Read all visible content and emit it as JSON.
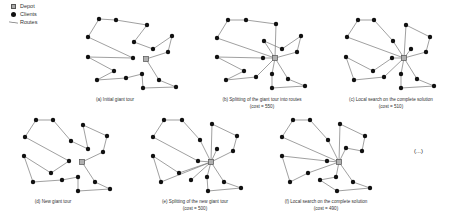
{
  "legend": {
    "depot_label": "Depot",
    "clients_label": "Clients",
    "routes_label": "Routes"
  },
  "colors": {
    "edge": "#777777",
    "client": "#111111",
    "depot_fill": "#b0b0b0",
    "depot_stroke": "#555555"
  },
  "panels": [
    {
      "id": "a",
      "caption": "(a) Initial giant tour",
      "cost": "",
      "caption_x": 115,
      "caption_y": 96,
      "depot": [
        146,
        59
      ],
      "clients": [
        [
          99,
          19
        ],
        [
          116,
          20
        ],
        [
          147,
          25
        ],
        [
          88,
          37
        ],
        [
          134,
          42
        ],
        [
          172,
          36
        ],
        [
          153,
          49
        ],
        [
          168,
          52
        ],
        [
          88,
          57
        ],
        [
          133,
          58
        ],
        [
          114,
          71
        ],
        [
          97,
          80
        ],
        [
          126,
          78
        ],
        [
          142,
          74
        ],
        [
          159,
          80
        ],
        [
          143,
          88
        ],
        [
          176,
          87
        ]
      ],
      "paths": [
        [
          [
            146,
            59
          ],
          [
            168,
            52
          ],
          [
            172,
            36
          ],
          [
            153,
            49
          ],
          [
            134,
            42
          ],
          [
            147,
            25
          ],
          [
            116,
            20
          ],
          [
            99,
            19
          ],
          [
            88,
            37
          ],
          [
            133,
            58
          ],
          [
            88,
            57
          ],
          [
            114,
            71
          ],
          [
            97,
            80
          ],
          [
            126,
            78
          ],
          [
            142,
            74
          ],
          [
            143,
            88
          ],
          [
            176,
            87
          ],
          [
            159,
            80
          ],
          [
            146,
            59
          ]
        ]
      ]
    },
    {
      "id": "b",
      "caption": "(b) Splitting of the giant tour into routes",
      "cost": "(cost = 550)",
      "caption_x": 262,
      "caption_y": 96,
      "depot": [
        275,
        58
      ],
      "clients": [
        [
          228,
          20
        ],
        [
          246,
          20
        ],
        [
          276,
          24
        ],
        [
          217,
          38
        ],
        [
          264,
          41
        ],
        [
          301,
          36
        ],
        [
          282,
          49
        ],
        [
          297,
          52
        ],
        [
          217,
          57
        ],
        [
          263,
          58
        ],
        [
          244,
          71
        ],
        [
          226,
          80
        ],
        [
          256,
          77
        ],
        [
          272,
          74
        ],
        [
          288,
          79
        ],
        [
          272,
          88
        ],
        [
          305,
          86
        ]
      ],
      "paths": [
        [
          [
            275,
            58
          ],
          [
            297,
            52
          ],
          [
            301,
            36
          ],
          [
            282,
            49
          ],
          [
            264,
            41
          ],
          [
            275,
            58
          ]
        ],
        [
          [
            275,
            58
          ],
          [
            276,
            24
          ],
          [
            246,
            20
          ],
          [
            228,
            20
          ],
          [
            217,
            38
          ],
          [
            275,
            58
          ]
        ],
        [
          [
            275,
            58
          ],
          [
            263,
            58
          ],
          [
            217,
            57
          ],
          [
            244,
            71
          ],
          [
            226,
            80
          ],
          [
            256,
            77
          ],
          [
            275,
            58
          ]
        ],
        [
          [
            275,
            58
          ],
          [
            272,
            74
          ],
          [
            272,
            88
          ],
          [
            305,
            86
          ],
          [
            288,
            79
          ],
          [
            275,
            58
          ]
        ]
      ]
    },
    {
      "id": "c",
      "caption": "(c) Local search on the complete solution",
      "cost": "(cost = 510)",
      "caption_x": 391,
      "caption_y": 96,
      "depot": [
        404,
        58
      ],
      "clients": [
        [
          358,
          20
        ],
        [
          374,
          20
        ],
        [
          347,
          37
        ],
        [
          393,
          41
        ],
        [
          406,
          25
        ],
        [
          430,
          37
        ],
        [
          411,
          49
        ],
        [
          426,
          52
        ],
        [
          346,
          57
        ],
        [
          392,
          58
        ],
        [
          373,
          71
        ],
        [
          354,
          80
        ],
        [
          384,
          77
        ],
        [
          401,
          74
        ],
        [
          417,
          79
        ],
        [
          401,
          88
        ],
        [
          434,
          86
        ]
      ],
      "paths": [
        [
          [
            404,
            58
          ],
          [
            406,
            25
          ],
          [
            430,
            37
          ],
          [
            426,
            52
          ],
          [
            404,
            58
          ]
        ],
        [
          [
            404,
            58
          ],
          [
            411,
            49
          ]
        ],
        [
          [
            404,
            58
          ],
          [
            393,
            41
          ],
          [
            374,
            20
          ],
          [
            358,
            20
          ],
          [
            347,
            37
          ],
          [
            404,
            58
          ]
        ],
        [
          [
            404,
            58
          ],
          [
            392,
            58
          ],
          [
            373,
            71
          ],
          [
            346,
            57
          ],
          [
            354,
            80
          ],
          [
            384,
            77
          ],
          [
            404,
            58
          ]
        ],
        [
          [
            404,
            58
          ],
          [
            401,
            74
          ],
          [
            401,
            88
          ],
          [
            434,
            86
          ],
          [
            417,
            79
          ],
          [
            404,
            58
          ]
        ]
      ]
    },
    {
      "id": "d",
      "caption": "(d) New giant tour",
      "cost": "",
      "caption_x": 53,
      "caption_y": 198,
      "depot": [
        82,
        162
      ],
      "clients": [
        [
          36,
          120
        ],
        [
          53,
          120
        ],
        [
          25,
          137
        ],
        [
          71,
          141
        ],
        [
          83,
          125
        ],
        [
          107,
          136
        ],
        [
          88,
          149
        ],
        [
          103,
          152
        ],
        [
          24,
          156
        ],
        [
          69,
          161
        ],
        [
          51,
          173
        ],
        [
          33,
          182
        ],
        [
          62,
          180
        ],
        [
          78,
          177
        ],
        [
          95,
          182
        ],
        [
          78,
          191
        ],
        [
          110,
          189
        ]
      ],
      "paths": [
        [
          [
            82,
            162
          ],
          [
            103,
            152
          ],
          [
            107,
            136
          ],
          [
            83,
            125
          ],
          [
            88,
            149
          ],
          [
            71,
            141
          ],
          [
            53,
            120
          ],
          [
            36,
            120
          ],
          [
            25,
            137
          ],
          [
            69,
            161
          ],
          [
            51,
            173
          ],
          [
            24,
            156
          ],
          [
            33,
            182
          ],
          [
            62,
            180
          ],
          [
            78,
            177
          ],
          [
            78,
            191
          ],
          [
            110,
            189
          ],
          [
            95,
            182
          ],
          [
            82,
            162
          ]
        ]
      ]
    },
    {
      "id": "e",
      "caption": "(e) Splitting of the new giant tour",
      "cost": "(cost = 500)",
      "caption_x": 195,
      "caption_y": 198,
      "depot": [
        211,
        162
      ],
      "clients": [
        [
          164,
          120
        ],
        [
          182,
          120
        ],
        [
          153,
          137
        ],
        [
          200,
          140
        ],
        [
          212,
          124
        ],
        [
          237,
          136
        ],
        [
          217,
          149
        ],
        [
          233,
          151
        ],
        [
          153,
          156
        ],
        [
          198,
          161
        ],
        [
          179,
          173
        ],
        [
          161,
          182
        ],
        [
          191,
          180
        ],
        [
          207,
          177
        ],
        [
          224,
          182
        ],
        [
          208,
          191
        ],
        [
          241,
          188
        ]
      ],
      "paths": [
        [
          [
            211,
            162
          ],
          [
            212,
            124
          ],
          [
            237,
            136
          ],
          [
            233,
            151
          ],
          [
            211,
            162
          ]
        ],
        [
          [
            211,
            162
          ],
          [
            217,
            149
          ]
        ],
        [
          [
            211,
            162
          ],
          [
            200,
            140
          ],
          [
            182,
            120
          ],
          [
            164,
            120
          ],
          [
            153,
            137
          ],
          [
            198,
            161
          ],
          [
            211,
            162
          ]
        ],
        [
          [
            211,
            162
          ],
          [
            179,
            173
          ],
          [
            153,
            156
          ],
          [
            161,
            182
          ],
          [
            211,
            162
          ]
        ],
        [
          [
            211,
            162
          ],
          [
            191,
            180
          ]
        ],
        [
          [
            211,
            162
          ],
          [
            207,
            177
          ],
          [
            208,
            191
          ],
          [
            241,
            188
          ],
          [
            224,
            182
          ],
          [
            211,
            162
          ]
        ]
      ]
    },
    {
      "id": "f",
      "caption": "(f) Local search on the complete solution",
      "cost": "(cost = 490)",
      "caption_x": 326,
      "caption_y": 198,
      "depot": [
        339,
        162
      ],
      "clients": [
        [
          293,
          120
        ],
        [
          310,
          120
        ],
        [
          282,
          137
        ],
        [
          328,
          140
        ],
        [
          340,
          124
        ],
        [
          365,
          136
        ],
        [
          346,
          148
        ],
        [
          362,
          151
        ],
        [
          282,
          156
        ],
        [
          327,
          161
        ],
        [
          308,
          173
        ],
        [
          290,
          182
        ],
        [
          320,
          180
        ],
        [
          336,
          177
        ],
        [
          353,
          182
        ],
        [
          337,
          191
        ],
        [
          370,
          188
        ]
      ],
      "paths": [
        [
          [
            339,
            162
          ],
          [
            340,
            124
          ],
          [
            365,
            136
          ],
          [
            362,
            151
          ],
          [
            346,
            148
          ],
          [
            339,
            162
          ]
        ],
        [
          [
            339,
            162
          ],
          [
            328,
            140
          ],
          [
            310,
            120
          ],
          [
            293,
            120
          ],
          [
            282,
            137
          ],
          [
            339,
            162
          ]
        ],
        [
          [
            339,
            162
          ],
          [
            327,
            161
          ],
          [
            282,
            156
          ],
          [
            290,
            182
          ],
          [
            308,
            173
          ],
          [
            339,
            162
          ]
        ],
        [
          [
            339,
            162
          ],
          [
            336,
            177
          ],
          [
            320,
            180
          ],
          [
            337,
            191
          ],
          [
            370,
            188
          ],
          [
            353,
            182
          ],
          [
            339,
            162
          ]
        ]
      ]
    }
  ],
  "continuation": "(...)"
}
